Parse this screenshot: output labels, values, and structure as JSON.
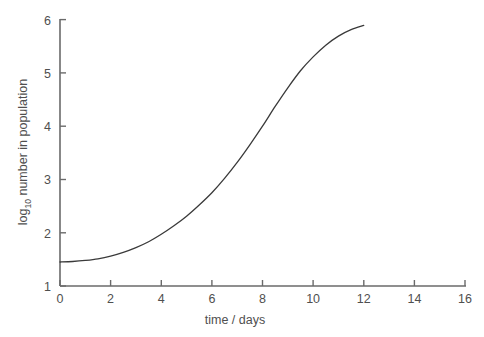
{
  "figure": {
    "background_color": "#ffffff",
    "axis_color": "#6a6a6a",
    "curve_color": "#3a3a3a",
    "label_color": "#4f4f4f"
  },
  "chart_data": {
    "type": "line",
    "title": "",
    "subtitle": "",
    "xlabel": "time / days",
    "ylabel_main": "log",
    "ylabel_sub": "10",
    "ylabel_rest": " number in population",
    "ylabel": "log10 number in population",
    "xlim": [
      0,
      16
    ],
    "ylim": [
      1,
      6
    ],
    "grid": false,
    "legend": false,
    "legend_position": "none",
    "xticks": [
      0,
      2,
      4,
      6,
      8,
      10,
      12,
      14,
      16
    ],
    "xtick_labels": [
      "0",
      "2",
      "4",
      "6",
      "8",
      "10",
      "12",
      "14",
      "16"
    ],
    "yticks": [
      1,
      2,
      3,
      4,
      5,
      6
    ],
    "ytick_labels": [
      "1",
      "2",
      "3",
      "4",
      "5",
      "6"
    ],
    "tick_direction": "in",
    "series": [
      {
        "name": "population growth",
        "color": "#3a3a3a",
        "line_width": 1.3,
        "x": [
          0,
          0.5,
          1,
          1.5,
          2,
          2.5,
          3,
          3.5,
          4,
          4.5,
          5,
          5.5,
          6,
          6.5,
          7,
          7.5,
          8,
          8.5,
          9,
          9.5,
          10,
          10.5,
          11,
          11.5,
          12
        ],
        "y": [
          1.45,
          1.46,
          1.48,
          1.51,
          1.56,
          1.63,
          1.72,
          1.83,
          1.97,
          2.13,
          2.31,
          2.52,
          2.75,
          3.02,
          3.32,
          3.65,
          4.0,
          4.37,
          4.72,
          5.04,
          5.3,
          5.52,
          5.69,
          5.81,
          5.89
        ]
      }
    ]
  }
}
